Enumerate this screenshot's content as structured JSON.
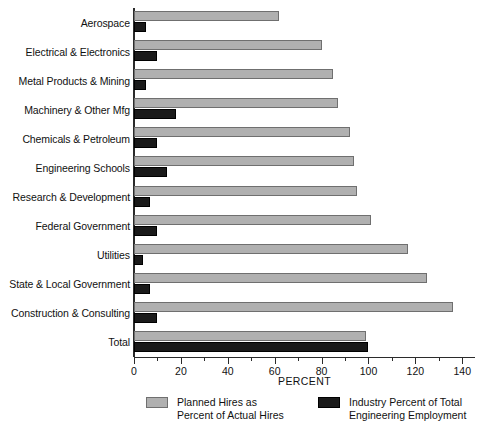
{
  "chart_data": {
    "type": "bar",
    "orientation": "horizontal",
    "title": "",
    "xlabel": "PERCENT",
    "ylabel": "",
    "xlim": [
      0,
      145
    ],
    "xticks": [
      0,
      20,
      40,
      60,
      80,
      100,
      120,
      140
    ],
    "xtick_labels": [
      "0",
      "20",
      "40",
      "60",
      "80",
      "100",
      "120",
      "140"
    ],
    "minor_tick_step": 10,
    "grid": false,
    "legend_position": "bottom",
    "categories": [
      "Aerospace",
      "Electrical & Electronics",
      "Metal Products & Mining",
      "Machinery & Other Mfg",
      "Chemicals & Petroleum",
      "Engineering Schools",
      "Research & Development",
      "Federal Government",
      "Utilities",
      "State & Local Government",
      "Construction & Consulting",
      "Total"
    ],
    "series": [
      {
        "name": "Planned Hires as Percent of Actual Hires",
        "legend_label_line1": "Planned Hires as",
        "legend_label_line2": "Percent of Actual Hires",
        "color": "#b0b0b0",
        "values": [
          62,
          80,
          85,
          87,
          92,
          94,
          95,
          101,
          117,
          125,
          136,
          99
        ]
      },
      {
        "name": "Industry Percent of Total Engineering Employment",
        "legend_label_line1": "Industry Percent of Total",
        "legend_label_line2": "Engineering Employment",
        "color": "#1a1a1a",
        "values": [
          5,
          10,
          5,
          18,
          10,
          14,
          7,
          10,
          4,
          7,
          10,
          100
        ]
      }
    ]
  },
  "colors": {
    "series_gray": "#b0b0b0",
    "series_gray_border": "#6f6f6f",
    "series_black": "#1a1a1a",
    "axis": "#2b2b2b",
    "background": "#ffffff"
  }
}
